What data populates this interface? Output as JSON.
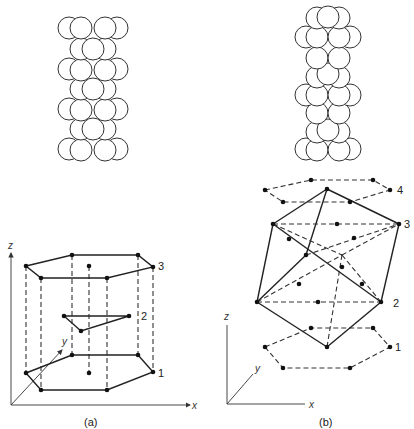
{
  "figure_a": {
    "caption": "(a)",
    "layer_labels": {
      "top": "3",
      "middle": "2",
      "bottom": "1"
    },
    "axis_labels": {
      "x": "x",
      "y": "y",
      "z": "z"
    }
  },
  "figure_b": {
    "caption": "(b)",
    "layer_labels": {
      "l4": "4",
      "l3": "3",
      "l2": "2",
      "l1": "1"
    },
    "axis_labels": {
      "x": "x",
      "y": "y",
      "z": "z"
    }
  }
}
